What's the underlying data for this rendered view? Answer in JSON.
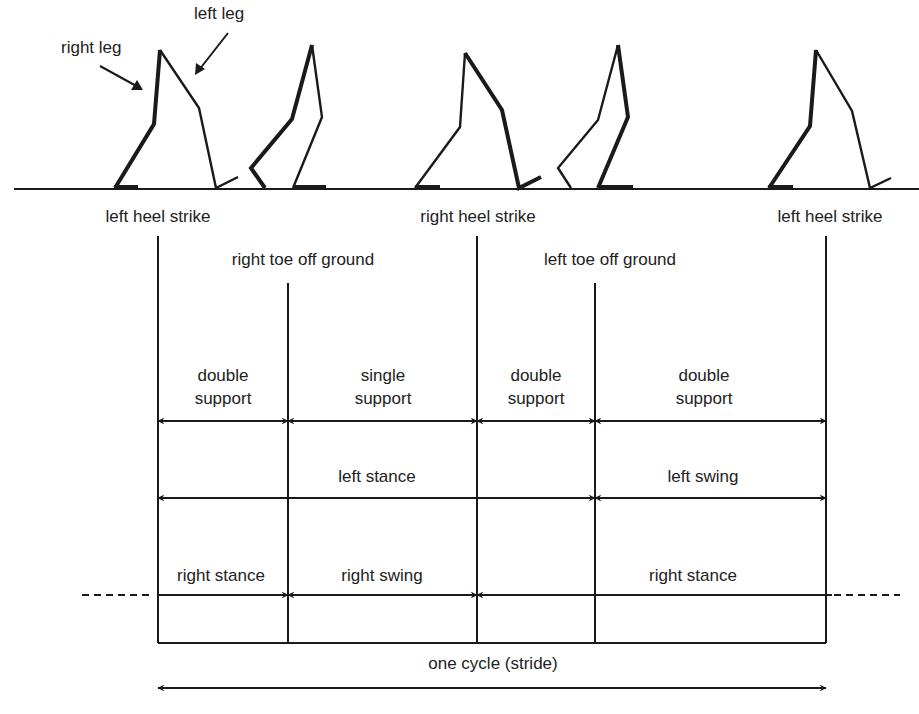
{
  "diagram": {
    "type": "gait-cycle",
    "leg_labels": {
      "right_leg": "right leg",
      "left_leg": "left leg"
    },
    "events": [
      {
        "label": "left heel strike",
        "x": 158
      },
      {
        "label": "right toe off ground",
        "x": 288
      },
      {
        "label": "right heel strike",
        "x": 477
      },
      {
        "label": "left toe off ground",
        "x": 595
      },
      {
        "label": "left heel strike",
        "x": 826
      }
    ],
    "support_phases": [
      {
        "line1": "double",
        "line2": "support"
      },
      {
        "line1": "single",
        "line2": "support"
      },
      {
        "line1": "double",
        "line2": "support"
      },
      {
        "line1": "double",
        "line2": "support"
      }
    ],
    "left_leg_phases": [
      {
        "label": "left stance"
      },
      {
        "label": "left swing"
      }
    ],
    "right_leg_phases": [
      {
        "label": "right stance"
      },
      {
        "label": "right swing"
      },
      {
        "label": "right stance"
      }
    ],
    "cycle_label": "one cycle (stride)",
    "line_color": "#1a1a1a"
  }
}
